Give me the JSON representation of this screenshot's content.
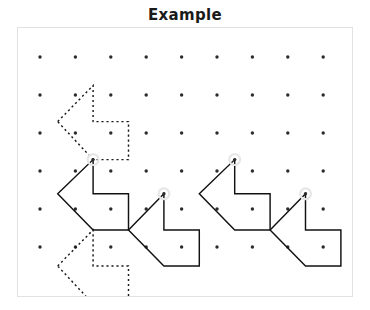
{
  "title": "Example",
  "colors": {
    "background": "#ffffff",
    "frame_border": "#e2e2e2",
    "dot": "#2b2b2b",
    "stroke_solid": "#121212",
    "stroke_dashed": "#1a1a1a",
    "highlight_ring": "#e6e6e6"
  },
  "grid": {
    "columns": 9,
    "rows": 6,
    "origin_x": 22,
    "origin_y": 29,
    "step_x": 35.4,
    "step_y": 38.0,
    "dot_radius": 1.7
  },
  "shapes": [
    {
      "name": "dashed-arrow-top-left",
      "style": "dashed",
      "closed": true,
      "points": [
        [
          0.5,
          1.7
        ],
        [
          1.5,
          0.75
        ],
        [
          1.5,
          1.7
        ],
        [
          2.5,
          1.7
        ],
        [
          2.5,
          2.7
        ],
        [
          1.5,
          2.7
        ]
      ]
    },
    {
      "name": "dashed-arrow-bottom-left",
      "style": "dashed",
      "closed": true,
      "points": [
        [
          0.5,
          5.5
        ],
        [
          1.5,
          4.55
        ],
        [
          1.5,
          5.5
        ],
        [
          2.5,
          5.5
        ],
        [
          2.5,
          6.5
        ],
        [
          1.5,
          6.5
        ]
      ]
    },
    {
      "name": "solid-arrow-one",
      "style": "solid",
      "closed": true,
      "points": [
        [
          0.5,
          3.6
        ],
        [
          1.5,
          2.7
        ],
        [
          1.5,
          3.6
        ],
        [
          2.5,
          3.6
        ],
        [
          2.5,
          4.55
        ],
        [
          1.5,
          4.55
        ]
      ]
    },
    {
      "name": "solid-arrow-two",
      "style": "solid",
      "closed": true,
      "points": [
        [
          2.5,
          4.55
        ],
        [
          3.5,
          3.6
        ],
        [
          3.5,
          4.55
        ],
        [
          4.5,
          4.55
        ],
        [
          4.5,
          5.5
        ],
        [
          3.5,
          5.5
        ]
      ]
    },
    {
      "name": "solid-arrow-three",
      "style": "solid",
      "closed": true,
      "points": [
        [
          4.5,
          3.6
        ],
        [
          5.5,
          2.7
        ],
        [
          5.5,
          3.6
        ],
        [
          6.5,
          3.6
        ],
        [
          6.5,
          4.55
        ],
        [
          5.5,
          4.55
        ]
      ]
    },
    {
      "name": "solid-arrow-four",
      "style": "solid",
      "closed": true,
      "points": [
        [
          6.5,
          4.55
        ],
        [
          7.5,
          3.6
        ],
        [
          7.5,
          4.55
        ],
        [
          8.5,
          4.55
        ],
        [
          8.5,
          5.5
        ],
        [
          7.5,
          5.5
        ]
      ]
    }
  ],
  "highlighted_vertices": [
    {
      "name": "highlight-vertex-a",
      "x": 1.5,
      "y": 2.7
    },
    {
      "name": "highlight-vertex-b",
      "x": 3.5,
      "y": 3.6
    },
    {
      "name": "highlight-vertex-c",
      "x": 5.5,
      "y": 2.7
    },
    {
      "name": "highlight-vertex-d",
      "x": 7.5,
      "y": 3.6
    }
  ]
}
